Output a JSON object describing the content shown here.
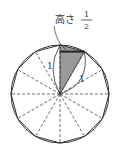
{
  "diagram": {
    "type": "regular-dodecagon-inscribed-in-circle",
    "label_height": "高さ",
    "fraction_num": "1",
    "fraction_den": "2",
    "side_label_left": "1",
    "side_label_right": "1",
    "sides": 12,
    "shaded_color": "#999999",
    "line_color": "#333333"
  }
}
